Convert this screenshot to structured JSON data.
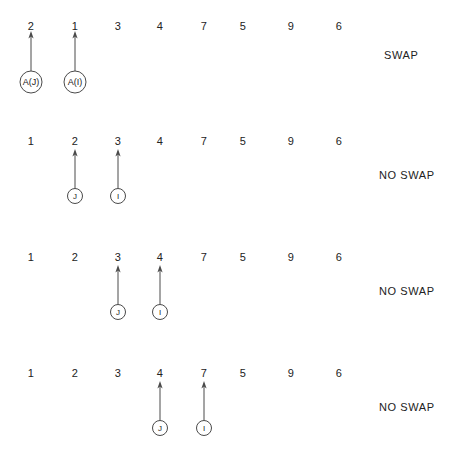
{
  "diagram": {
    "columns": 8,
    "stroke_color": "#4a4a4a",
    "text_color": "#222222",
    "background": "#ffffff",
    "column_x": [
      31,
      75,
      118,
      160,
      204,
      243,
      291,
      339
    ],
    "rows": [
      {
        "id": "pass-step-1",
        "values": [
          "2",
          "1",
          "3",
          "4",
          "7",
          "5",
          "9",
          "6"
        ],
        "numbers_y": 20,
        "verdict": "SWAP",
        "verdict_x": 384,
        "verdict_y": 49,
        "markers": [
          {
            "label": "A(J)",
            "name": "pointer-a-j",
            "column": 0,
            "radius": 11,
            "circle_cy": 82,
            "arrow_top_y": 31,
            "font_size": 9
          },
          {
            "label": "A(I)",
            "name": "pointer-a-i",
            "column": 1,
            "radius": 11,
            "circle_cy": 82,
            "arrow_top_y": 31,
            "font_size": 9
          }
        ]
      },
      {
        "id": "pass-step-2",
        "values": [
          "1",
          "2",
          "3",
          "4",
          "7",
          "5",
          "9",
          "6"
        ],
        "numbers_y": 135,
        "verdict": "NO SWAP",
        "verdict_x": 379,
        "verdict_y": 169,
        "markers": [
          {
            "label": "J",
            "name": "pointer-j",
            "column": 1,
            "radius": 7.5,
            "circle_cy": 196,
            "arrow_top_y": 149,
            "font_size": 8
          },
          {
            "label": "I",
            "name": "pointer-i",
            "column": 2,
            "radius": 7.5,
            "circle_cy": 196,
            "arrow_top_y": 149,
            "font_size": 8
          }
        ]
      },
      {
        "id": "pass-step-3",
        "values": [
          "1",
          "2",
          "3",
          "4",
          "7",
          "5",
          "9",
          "6"
        ],
        "numbers_y": 251,
        "verdict": "NO SWAP",
        "verdict_x": 379,
        "verdict_y": 285,
        "markers": [
          {
            "label": "J",
            "name": "pointer-j",
            "column": 2,
            "radius": 7.5,
            "circle_cy": 312,
            "arrow_top_y": 265,
            "font_size": 8
          },
          {
            "label": "I",
            "name": "pointer-i",
            "column": 3,
            "radius": 7.5,
            "circle_cy": 312,
            "arrow_top_y": 265,
            "font_size": 8
          }
        ]
      },
      {
        "id": "pass-step-4",
        "values": [
          "1",
          "2",
          "3",
          "4",
          "7",
          "5",
          "9",
          "6"
        ],
        "numbers_y": 367,
        "verdict": "NO SWAP",
        "verdict_x": 379,
        "verdict_y": 401,
        "markers": [
          {
            "label": "J",
            "name": "pointer-j",
            "column": 3,
            "radius": 7.5,
            "circle_cy": 428,
            "arrow_top_y": 381,
            "font_size": 8
          },
          {
            "label": "I",
            "name": "pointer-i",
            "column": 4,
            "radius": 7.5,
            "circle_cy": 428,
            "arrow_top_y": 381,
            "font_size": 8
          }
        ]
      }
    ]
  }
}
